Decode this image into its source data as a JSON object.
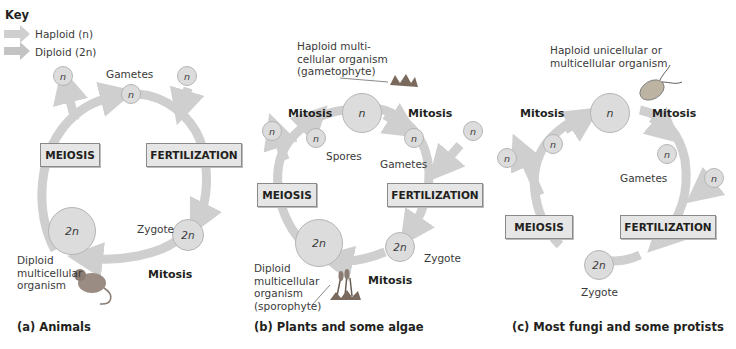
{
  "key": {
    "title": "Key",
    "items": [
      {
        "label": "Haploid (n)",
        "color": "#c8c8c8"
      },
      {
        "label": "Diploid (2n)",
        "color": "#c8c8c8"
      }
    ]
  },
  "colors": {
    "arrow": "#cfcfcf",
    "circle": "#dcdcdc",
    "box": "#e6e6e6",
    "box_border": "#8a8a8a",
    "text": "#231f20"
  },
  "panels": [
    {
      "caption": "(a) Animals",
      "process_left": "MEIOSIS",
      "process_right": "FERTILIZATION",
      "labels": {
        "gametes": "Gametes",
        "zygote": "Zygote",
        "mitosis": "Mitosis",
        "organism": [
          "Diploid",
          "multicellular",
          "organism"
        ]
      },
      "cells": {
        "haploid": "n",
        "diploid": "2n"
      }
    },
    {
      "caption": "(b) Plants and some algae",
      "process_left": "MEIOSIS",
      "process_right": "FERTILIZATION",
      "labels": {
        "haploid_organism": [
          "Haploid multi-",
          "cellular organism",
          "(gametophyte)"
        ],
        "mitosis_left": "Mitosis",
        "mitosis_right": "Mitosis",
        "spores": "Spores",
        "gametes": "Gametes",
        "zygote": "Zygote",
        "mitosis_bottom": "Mitosis",
        "diploid_organism": [
          "Diploid",
          "multicellular",
          "organism",
          "(sporophyte)"
        ]
      },
      "cells": {
        "haploid": "n",
        "diploid": "2n"
      }
    },
    {
      "caption": "(c) Most fungi and some protists",
      "process_left": "MEIOSIS",
      "process_right": "FERTILIZATION",
      "labels": {
        "haploid_organism": [
          "Haploid unicellular or",
          "multicellular organism"
        ],
        "mitosis_left": "Mitosis",
        "mitosis_right": "Mitosis",
        "gametes": "Gametes",
        "zygote": "Zygote"
      },
      "cells": {
        "haploid": "n",
        "diploid": "2n"
      }
    }
  ]
}
